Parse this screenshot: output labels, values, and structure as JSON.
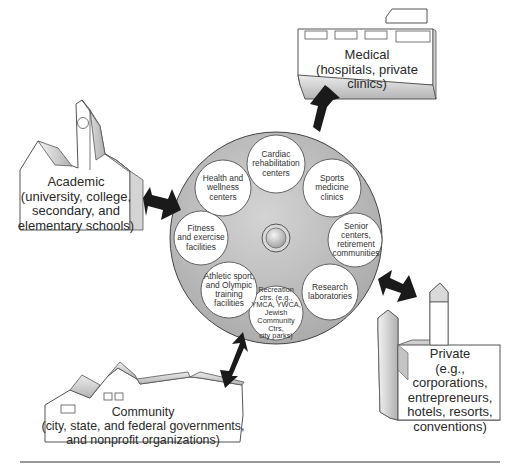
{
  "diagram": {
    "hub": {
      "name": "central-hub",
      "segments": [
        {
          "id": "cardiac",
          "lines": [
            "Cardiac",
            "rehabilitation",
            "centers"
          ]
        },
        {
          "id": "sports",
          "lines": [
            "Sports",
            "medicine",
            "clinics"
          ]
        },
        {
          "id": "senior",
          "lines": [
            "Senior centers,",
            "retirement",
            "communities"
          ]
        },
        {
          "id": "research",
          "lines": [
            "Research",
            "laboratories"
          ]
        },
        {
          "id": "recreation",
          "lines": [
            "Recreation",
            "ctrs. (e.g.,",
            "YMCA, YWCA,",
            "Jewish",
            "Community Ctrs,",
            "city parks)"
          ]
        },
        {
          "id": "athletic",
          "lines": [
            "Athletic sport,",
            "and Olympic",
            "training",
            "facilities"
          ]
        },
        {
          "id": "fitness",
          "lines": [
            "Fitness",
            "and exercise",
            "facilities"
          ]
        },
        {
          "id": "health",
          "lines": [
            "Health and",
            "wellness",
            "centers"
          ]
        }
      ]
    },
    "sectors": {
      "medical": {
        "title": "Medical",
        "subtitle": "(hospitals, private clinics)"
      },
      "academic": {
        "title": "Academic",
        "lines": [
          "(university, college,",
          "secondary, and",
          "elementary schools)"
        ]
      },
      "private": {
        "title": "Private",
        "lines": [
          "(e.g., corporations,",
          "entrepreneurs,",
          "hotels, resorts,",
          "conventions)"
        ]
      },
      "community": {
        "title": "Community",
        "lines": [
          "(city, state, and federal governments,",
          "and nonprofit organizations)"
        ]
      }
    },
    "colors": {
      "disc": "#b9b9b9",
      "arrow": "#1a1a1a",
      "building_face": "#ffffff",
      "building_shade": "#c8c8c8",
      "rule": "#9a9a9a"
    }
  }
}
